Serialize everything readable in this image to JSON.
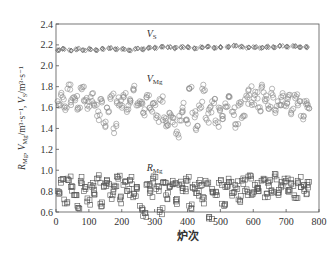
{
  "chart_data": {
    "type": "scatter",
    "title": "",
    "xlabel": "炉次",
    "ylabel": "R_Mg, V_Mg/m³·s⁻¹, V_S/m³·s⁻¹",
    "ylabel_parts": {
      "r": "R",
      "r_sub": "Mg",
      "sep1": ", ",
      "v": "V",
      "v_sub": "Mg",
      "v_unit": "/m³·s⁻¹, ",
      "vs": "V",
      "vs_sub": "S",
      "vs_unit": "/m³·s⁻¹"
    },
    "xlim": [
      0,
      800
    ],
    "ylim": [
      0.6,
      2.4
    ],
    "x_ticks": [
      0,
      100,
      200,
      300,
      400,
      500,
      600,
      700,
      800
    ],
    "x_tick_labels": [
      "0",
      "100",
      "200",
      "300",
      "400",
      "500",
      "600",
      "700",
      "800"
    ],
    "y_ticks": [
      0.6,
      0.8,
      1.0,
      1.2,
      1.4,
      1.6,
      1.8,
      2.0,
      2.2,
      2.4
    ],
    "y_tick_labels": [
      "0.6",
      "0.8",
      "1.0",
      "1.2",
      "1.4",
      "1.6",
      "1.8",
      "2.0",
      "2.2",
      "2.4"
    ],
    "grid": false,
    "legend": "inline labels",
    "annotations": [
      {
        "text": "V",
        "sub": "S",
        "x": 300,
        "y": 2.28
      },
      {
        "text": "V",
        "sub": "Mg",
        "x": 300,
        "y": 1.84
      },
      {
        "text": "R",
        "sub": "Mg",
        "x": 300,
        "y": 0.99
      }
    ],
    "series": [
      {
        "name": "V_S",
        "marker": "diamond",
        "x_range": [
          0,
          770
        ],
        "y_range": [
          2.14,
          2.2
        ],
        "mean": 2.17,
        "points": [
          [
            5,
            2.15
          ],
          [
            20,
            2.16
          ],
          [
            40,
            2.15
          ],
          [
            60,
            2.16
          ],
          [
            80,
            2.15
          ],
          [
            100,
            2.16
          ],
          [
            120,
            2.15
          ],
          [
            140,
            2.16
          ],
          [
            160,
            2.17
          ],
          [
            180,
            2.16
          ],
          [
            200,
            2.16
          ],
          [
            220,
            2.15
          ],
          [
            240,
            2.16
          ],
          [
            260,
            2.16
          ],
          [
            280,
            2.17
          ],
          [
            300,
            2.17
          ],
          [
            320,
            2.18
          ],
          [
            340,
            2.18
          ],
          [
            360,
            2.17
          ],
          [
            380,
            2.18
          ],
          [
            400,
            2.18
          ],
          [
            420,
            2.17
          ],
          [
            440,
            2.18
          ],
          [
            460,
            2.18
          ],
          [
            480,
            2.17
          ],
          [
            500,
            2.18
          ],
          [
            520,
            2.18
          ],
          [
            540,
            2.19
          ],
          [
            560,
            2.18
          ],
          [
            580,
            2.17
          ],
          [
            600,
            2.18
          ],
          [
            620,
            2.17
          ],
          [
            640,
            2.18
          ],
          [
            660,
            2.18
          ],
          [
            680,
            2.19
          ],
          [
            700,
            2.18
          ],
          [
            720,
            2.19
          ],
          [
            740,
            2.18
          ],
          [
            760,
            2.18
          ]
        ]
      },
      {
        "name": "V_Mg",
        "marker": "circle",
        "x_range": [
          0,
          770
        ],
        "y_range": [
          1.3,
          1.82
        ],
        "mean": 1.64,
        "points": [
          [
            5,
            1.66
          ],
          [
            15,
            1.72
          ],
          [
            25,
            1.6
          ],
          [
            35,
            1.78
          ],
          [
            45,
            1.65
          ],
          [
            55,
            1.7
          ],
          [
            65,
            1.58
          ],
          [
            75,
            1.79
          ],
          [
            85,
            1.67
          ],
          [
            95,
            1.62
          ],
          [
            105,
            1.7
          ],
          [
            115,
            1.64
          ],
          [
            125,
            1.52
          ],
          [
            135,
            1.68
          ],
          [
            145,
            1.45
          ],
          [
            155,
            1.6
          ],
          [
            165,
            1.7
          ],
          [
            175,
            1.4
          ],
          [
            185,
            1.66
          ],
          [
            195,
            1.63
          ],
          [
            205,
            1.72
          ],
          [
            215,
            1.58
          ],
          [
            225,
            1.68
          ],
          [
            235,
            1.78
          ],
          [
            245,
            1.62
          ],
          [
            255,
            1.66
          ],
          [
            265,
            1.55
          ],
          [
            275,
            1.7
          ],
          [
            285,
            1.6
          ],
          [
            295,
            1.64
          ],
          [
            305,
            1.5
          ],
          [
            315,
            1.68
          ],
          [
            325,
            1.48
          ],
          [
            335,
            1.42
          ],
          [
            345,
            1.55
          ],
          [
            355,
            1.46
          ],
          [
            365,
            1.35
          ],
          [
            375,
            1.52
          ],
          [
            385,
            1.6
          ],
          [
            395,
            1.48
          ],
          [
            405,
            1.78
          ],
          [
            415,
            1.55
          ],
          [
            425,
            1.4
          ],
          [
            435,
            1.62
          ],
          [
            445,
            1.78
          ],
          [
            455,
            1.5
          ],
          [
            465,
            1.58
          ],
          [
            475,
            1.66
          ],
          [
            485,
            1.45
          ],
          [
            495,
            1.6
          ],
          [
            505,
            1.52
          ],
          [
            515,
            1.64
          ],
          [
            525,
            1.7
          ],
          [
            535,
            1.56
          ],
          [
            545,
            1.44
          ],
          [
            555,
            1.62
          ],
          [
            565,
            1.5
          ],
          [
            575,
            1.68
          ],
          [
            585,
            1.76
          ],
          [
            595,
            1.65
          ],
          [
            605,
            1.72
          ],
          [
            615,
            1.6
          ],
          [
            625,
            1.79
          ],
          [
            635,
            1.68
          ],
          [
            645,
            1.62
          ],
          [
            655,
            1.74
          ],
          [
            665,
            1.58
          ],
          [
            675,
            1.66
          ],
          [
            685,
            1.7
          ],
          [
            695,
            1.62
          ],
          [
            705,
            1.68
          ],
          [
            715,
            1.55
          ],
          [
            725,
            1.72
          ],
          [
            735,
            1.64
          ],
          [
            745,
            1.52
          ],
          [
            755,
            1.66
          ],
          [
            765,
            1.6
          ]
        ]
      },
      {
        "name": "R_Mg",
        "marker": "square",
        "x_range": [
          0,
          770
        ],
        "y_range": [
          0.55,
          0.96
        ],
        "mean": 0.82,
        "points": [
          [
            5,
            0.8
          ],
          [
            15,
            0.88
          ],
          [
            25,
            0.72
          ],
          [
            35,
            0.92
          ],
          [
            45,
            0.84
          ],
          [
            55,
            0.76
          ],
          [
            65,
            0.66
          ],
          [
            75,
            0.9
          ],
          [
            85,
            0.8
          ],
          [
            95,
            0.7
          ],
          [
            105,
            0.86
          ],
          [
            115,
            0.78
          ],
          [
            125,
            0.92
          ],
          [
            135,
            0.68
          ],
          [
            145,
            0.84
          ],
          [
            155,
            0.9
          ],
          [
            165,
            0.76
          ],
          [
            175,
            0.82
          ],
          [
            185,
            0.94
          ],
          [
            195,
            0.72
          ],
          [
            205,
            0.86
          ],
          [
            215,
            0.8
          ],
          [
            225,
            0.9
          ],
          [
            235,
            0.74
          ],
          [
            245,
            0.84
          ],
          [
            255,
            0.66
          ],
          [
            265,
            0.56
          ],
          [
            275,
            0.86
          ],
          [
            285,
            0.78
          ],
          [
            295,
            0.92
          ],
          [
            305,
            0.82
          ],
          [
            315,
            0.6
          ],
          [
            325,
            0.88
          ],
          [
            335,
            0.76
          ],
          [
            345,
            0.84
          ],
          [
            355,
            0.9
          ],
          [
            365,
            0.7
          ],
          [
            375,
            0.86
          ],
          [
            385,
            0.8
          ],
          [
            395,
            0.92
          ],
          [
            405,
            0.66
          ],
          [
            415,
            0.84
          ],
          [
            425,
            0.78
          ],
          [
            435,
            0.88
          ],
          [
            445,
            0.72
          ],
          [
            455,
            0.9
          ],
          [
            465,
            0.55
          ],
          [
            475,
            0.82
          ],
          [
            485,
            0.76
          ],
          [
            495,
            0.88
          ],
          [
            505,
            0.68
          ],
          [
            515,
            0.84
          ],
          [
            525,
            0.92
          ],
          [
            535,
            0.78
          ],
          [
            545,
            0.86
          ],
          [
            555,
            0.72
          ],
          [
            565,
            0.9
          ],
          [
            575,
            0.8
          ],
          [
            585,
            0.94
          ],
          [
            595,
            0.76
          ],
          [
            605,
            0.86
          ],
          [
            615,
            0.82
          ],
          [
            625,
            0.9
          ],
          [
            635,
            0.74
          ],
          [
            645,
            0.88
          ],
          [
            655,
            0.8
          ],
          [
            665,
            0.94
          ],
          [
            675,
            0.78
          ],
          [
            685,
            0.86
          ],
          [
            695,
            0.92
          ],
          [
            705,
            0.8
          ],
          [
            715,
            0.88
          ],
          [
            725,
            0.76
          ],
          [
            735,
            0.9
          ],
          [
            745,
            0.84
          ],
          [
            755,
            0.8
          ],
          [
            765,
            0.86
          ]
        ]
      }
    ]
  }
}
